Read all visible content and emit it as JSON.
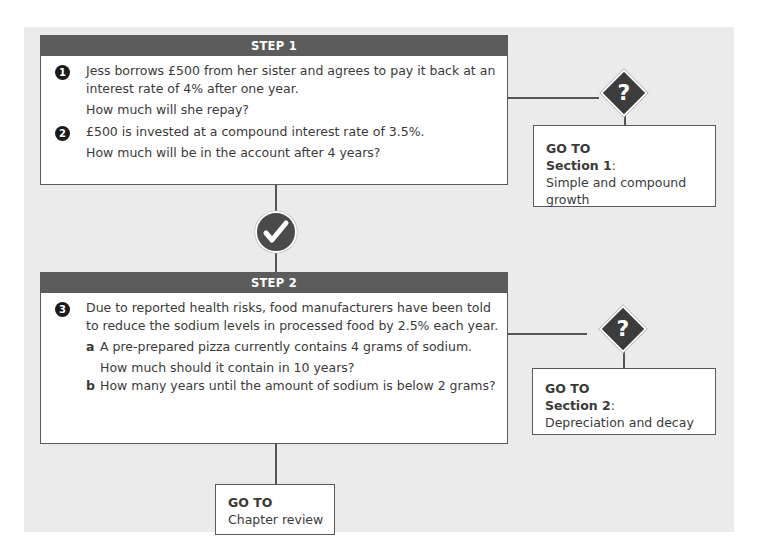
{
  "step1": {
    "header": "STEP 1",
    "questions": [
      {
        "number": "1",
        "lines": [
          "Jess borrows £500 from her sister and agrees to pay it back at an",
          "interest rate of 4% after one year."
        ],
        "prompt": "How much will she repay?"
      },
      {
        "number": "2",
        "lines": [
          "£500 is invested at a compound interest rate of 3.5%."
        ],
        "prompt": "How much will be in the account after 4 years?"
      }
    ],
    "decision_icon": "question-mark",
    "goto": {
      "label": "GO TO",
      "section": "Section 1",
      "colon": ":",
      "title_lines": [
        "Simple and compound",
        "growth"
      ]
    }
  },
  "pass_icon": "check-mark",
  "step2": {
    "header": "STEP 2",
    "question": {
      "number": "3",
      "lines": [
        "Due to reported health risks, food manufacturers have been told",
        "to reduce the sodium levels in processed food by 2.5% each year."
      ],
      "parts": [
        {
          "label": "a",
          "text": "A pre-prepared pizza currently contains 4 grams of sodium.",
          "prompt": "How much should it contain in 10 years?"
        },
        {
          "label": "b",
          "text": "How many years until the amount of sodium is below 2 grams?"
        }
      ]
    },
    "decision_icon": "question-mark",
    "goto": {
      "label": "GO TO",
      "section": "Section 2",
      "colon": ":",
      "title": "Depreciation and decay"
    }
  },
  "final": {
    "goto_label": "GO TO",
    "title": "Chapter review"
  },
  "colors": {
    "panel_bg": "#ebebeb",
    "header_bg": "#5c5c5c",
    "diamond": "#3c3c3c",
    "check_circle": "#4a4a4a",
    "line": "#555555"
  }
}
